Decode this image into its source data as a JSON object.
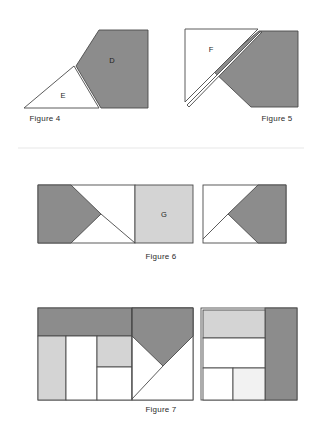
{
  "page": {
    "background_color": "#ffffff",
    "width": 322,
    "height": 428
  },
  "palette": {
    "shaded_gray": "#8c8c8c",
    "light_gray": "#d4d4d4",
    "white_fill": "#ffffff",
    "outline": "#4a4a4a",
    "divider": "#e8e8e8",
    "text": "#2b2b2b"
  },
  "divider": {
    "name": "section-divider",
    "y": 148
  },
  "figures": [
    {
      "id": "figure-4",
      "caption": "Figure 4",
      "shape_labels": [
        {
          "key": "D",
          "text": "D"
        },
        {
          "key": "E",
          "text": "E"
        }
      ],
      "description": "A shaded pentagon labelled D adjacent to an unshaded triangle labelled E"
    },
    {
      "id": "figure-5",
      "caption": "Figure 5",
      "shape_labels": [
        {
          "key": "F",
          "text": "F"
        }
      ],
      "description": "An unshaded right triangle labelled F overlapping a shaded pentagon forming a square"
    },
    {
      "id": "figure-6",
      "caption": "Figure 6",
      "shape_labels": [
        {
          "key": "G",
          "text": "G"
        }
      ],
      "description": "Two rectangles: left with shaded arrow and light square G, right mirrored shaded arrow"
    },
    {
      "id": "figure-7",
      "caption": "Figure 7",
      "shape_labels": [],
      "description": "Two composite rectangles partitioned into shaded bands, light and white panels and a shaded chevron"
    }
  ],
  "captions": {
    "figure4": "Figure 4",
    "figure5": "Figure 5",
    "figure6": "Figure 6",
    "figure7": "Figure 7"
  },
  "labels": {
    "d": "D",
    "e": "E",
    "f": "F",
    "g": "G"
  }
}
